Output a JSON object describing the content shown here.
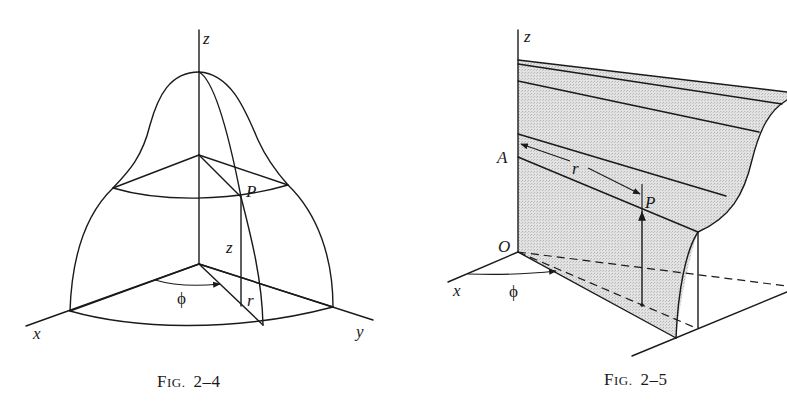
{
  "figures": [
    {
      "id": "fig-2-4",
      "caption": {
        "prefix_big": "F",
        "prefix_small": "IG.",
        "number": "2–4"
      },
      "labels": {
        "z_axis": "z",
        "x_axis": "x",
        "y_axis": "y",
        "point": "P",
        "height": "z",
        "radius": "r",
        "angle": "ϕ"
      }
    },
    {
      "id": "fig-2-5",
      "caption": {
        "prefix_big": "F",
        "prefix_small": "IG.",
        "number": "2–5"
      },
      "labels": {
        "z_axis": "z",
        "x_axis": "x",
        "point": "P",
        "point_a": "A",
        "origin": "O",
        "radius": "r",
        "angle": "ϕ"
      }
    }
  ],
  "colors": {
    "ink": "#1a1a1a",
    "shade": "#d9d9d9",
    "paper": "#ffffff"
  }
}
